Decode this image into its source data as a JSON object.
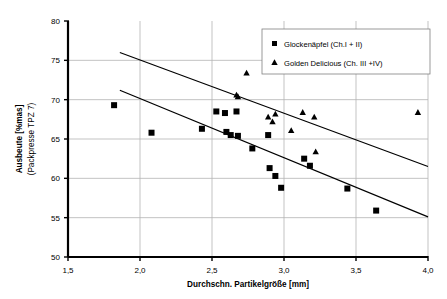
{
  "chart_data": {
    "type": "scatter",
    "title": "",
    "xlabel": "Durchschn. Partikelgröße [mm]",
    "ylabel": "Ausbeute [%mas]",
    "ylabel_line2": "(Packpresse TPZ 7)",
    "xlim": [
      1.5,
      4.0
    ],
    "ylim": [
      50,
      80
    ],
    "xticks": [
      1.5,
      2.0,
      2.5,
      3.0,
      3.5,
      4.0
    ],
    "xtick_labels": [
      "1,5",
      "2,0",
      "2,5",
      "3,0",
      "3,5",
      "4,0"
    ],
    "yticks": [
      50,
      55,
      60,
      65,
      70,
      75,
      80
    ],
    "ytick_labels": [
      "50",
      "55",
      "60",
      "65",
      "70",
      "75",
      "80"
    ],
    "grid": true,
    "grid_color": "#b4b4b4",
    "axis_color": "#000000",
    "legend_position": "top-right",
    "series": [
      {
        "name": "Glockenäpfel (Ch.I + II)",
        "marker": "square",
        "color": "#000000",
        "points": [
          [
            1.82,
            69.3
          ],
          [
            2.08,
            65.8
          ],
          [
            2.43,
            66.3
          ],
          [
            2.53,
            68.5
          ],
          [
            2.59,
            68.3
          ],
          [
            2.6,
            65.9
          ],
          [
            2.63,
            65.5
          ],
          [
            2.67,
            68.5
          ],
          [
            2.68,
            65.4
          ],
          [
            2.78,
            63.8
          ],
          [
            2.89,
            65.5
          ],
          [
            2.9,
            61.3
          ],
          [
            2.94,
            60.3
          ],
          [
            2.98,
            58.8
          ],
          [
            3.14,
            62.5
          ],
          [
            3.18,
            61.6
          ],
          [
            3.44,
            58.7
          ],
          [
            3.64,
            55.9
          ]
        ]
      },
      {
        "name": "Golden Delicious (Ch. III +IV)",
        "marker": "triangle",
        "color": "#000000",
        "points": [
          [
            2.67,
            70.6
          ],
          [
            2.68,
            70.4
          ],
          [
            2.74,
            73.4
          ],
          [
            2.89,
            67.8
          ],
          [
            2.92,
            67.2
          ],
          [
            2.94,
            68.2
          ],
          [
            3.05,
            66.1
          ],
          [
            3.13,
            68.4
          ],
          [
            3.21,
            67.8
          ],
          [
            3.22,
            63.4
          ],
          [
            3.93,
            68.4
          ]
        ]
      }
    ],
    "trend_lines": [
      {
        "name": "upper-trend-line",
        "x1": 1.86,
        "y1": 76.0,
        "x2": 4.0,
        "y2": 61.5
      },
      {
        "name": "lower-trend-line",
        "x1": 1.86,
        "y1": 71.2,
        "x2": 4.0,
        "y2": 55.1
      }
    ]
  },
  "legend": {
    "entries": [
      {
        "label": "Glockenäpfel (Ch.I + II)",
        "marker": "square"
      },
      {
        "label": "Golden Delicious (Ch. III +IV)",
        "marker": "triangle"
      }
    ]
  }
}
